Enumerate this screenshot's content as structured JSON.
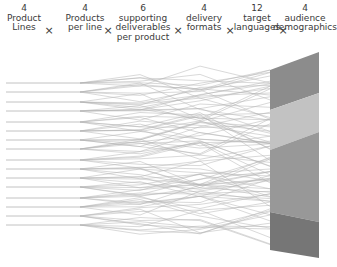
{
  "header": {
    "columns": [
      {
        "number": "4",
        "label": "Product\nLines",
        "x": 24
      },
      {
        "number": "4",
        "label": "Products\nper line",
        "x": 85
      },
      {
        "number": "6",
        "label": "supporting\ndeliverables\nper product",
        "x": 143
      },
      {
        "number": "4",
        "label": "delivery\nformats",
        "x": 204
      },
      {
        "number": "12",
        "label": "target\nlanguages",
        "x": 257
      },
      {
        "number": "4",
        "label": "audience\ndemographics",
        "x": 305
      }
    ],
    "operator": "×",
    "operator_positions": [
      49,
      108,
      178,
      230,
      283
    ]
  },
  "diagram": {
    "line_color": "#9a9a9a",
    "left_lines_y": [
      83,
      92,
      102,
      111,
      122,
      131,
      140,
      149,
      160,
      169,
      178,
      187,
      198,
      207,
      216,
      225
    ],
    "fan_start_x": 80,
    "block": {
      "left_x": 270,
      "right_x": 319,
      "bands": [
        {
          "name": "demographic-1",
          "color": "#8c8c8c",
          "left_top": 70,
          "right_top": 52,
          "left_bottom": 110,
          "right_bottom": 93
        },
        {
          "name": "demographic-2",
          "color": "#c2c2c2",
          "left_top": 110,
          "right_top": 93,
          "left_bottom": 150,
          "right_bottom": 132
        },
        {
          "name": "demographic-3",
          "color": "#989898",
          "left_top": 150,
          "right_top": 132,
          "left_bottom": 212,
          "right_bottom": 222
        },
        {
          "name": "demographic-4",
          "color": "#767676",
          "left_top": 212,
          "right_top": 222,
          "left_bottom": 250,
          "right_bottom": 258
        }
      ]
    }
  }
}
